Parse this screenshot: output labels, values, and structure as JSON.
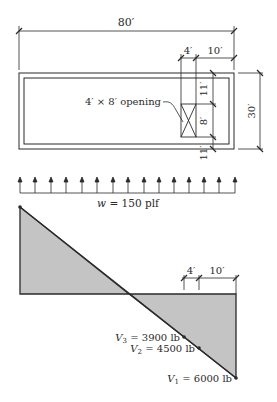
{
  "plan": {
    "overall_length": "80′",
    "opening_offset": "4′",
    "edge_distance": "10′",
    "width": "30′",
    "top_segment": "11′",
    "opening_height": "8′",
    "bottom_segment": "11′",
    "opening_label": "4′ × 8′ opening"
  },
  "load": {
    "label_var": "w",
    "label_value": " = 150 plf"
  },
  "shear_diagram": {
    "dim_left": "4′",
    "dim_right": "10′",
    "v3": {
      "var": "V",
      "sub": "3",
      "value": " = 3900 lb"
    },
    "v2": {
      "var": "V",
      "sub": "2",
      "value": " = 4500 lb"
    },
    "v1": {
      "var": "V",
      "sub": "1",
      "value": " = 6000 lb"
    }
  },
  "colors": {
    "line": "#2a2a2a",
    "fill": "#c4c4c4"
  }
}
